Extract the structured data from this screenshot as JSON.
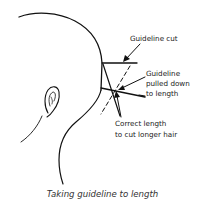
{
  "figure": {
    "labels": {
      "guideline_cut": "Guideline cut",
      "guideline_pulled_line1": "Guideline",
      "guideline_pulled_line2": "pulled down",
      "guideline_pulled_line3": "to length",
      "correct_length_line1": "Correct length",
      "correct_length_line2": "to cut longer hair"
    },
    "caption": "Taking guideline to length",
    "colors": {
      "line": "#111111",
      "text": "#1a1a1a",
      "caption": "#333333",
      "background": "#ffffff"
    }
  }
}
